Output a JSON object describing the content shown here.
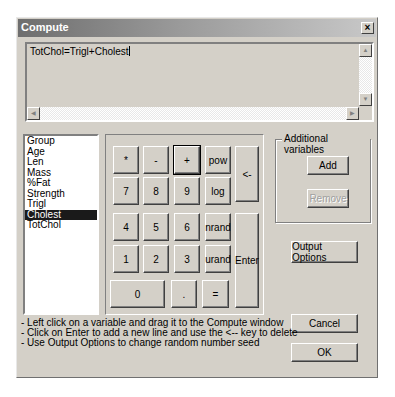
{
  "window": {
    "title": "Compute",
    "close_label": "×"
  },
  "editor": {
    "text": "TotChol=Trigl+Cholest"
  },
  "variables": {
    "items": [
      "Group",
      "Age",
      "Len",
      "Mass",
      "%Fat",
      "Strength",
      "Trigl",
      "Cholest",
      "TotChol"
    ],
    "selected": "Cholest"
  },
  "keypad": {
    "keys": [
      {
        "label": "*",
        "name": "key-multiply"
      },
      {
        "label": "-",
        "name": "key-minus"
      },
      {
        "label": "+",
        "name": "key-plus"
      },
      {
        "label": "pow",
        "name": "key-pow"
      },
      {
        "label": "<-",
        "name": "key-backspace"
      },
      {
        "label": "7",
        "name": "key-7"
      },
      {
        "label": "8",
        "name": "key-8"
      },
      {
        "label": "9",
        "name": "key-9"
      },
      {
        "label": "log",
        "name": "key-log"
      },
      {
        "label": "4",
        "name": "key-4"
      },
      {
        "label": "5",
        "name": "key-5"
      },
      {
        "label": "6",
        "name": "key-6"
      },
      {
        "label": "nrand",
        "name": "key-nrand"
      },
      {
        "label": "Enter",
        "name": "key-enter"
      },
      {
        "label": "1",
        "name": "key-1"
      },
      {
        "label": "2",
        "name": "key-2"
      },
      {
        "label": "3",
        "name": "key-3"
      },
      {
        "label": "urand",
        "name": "key-urand"
      },
      {
        "label": "0",
        "name": "key-0"
      },
      {
        "label": ".",
        "name": "key-decimal"
      },
      {
        "label": "=",
        "name": "key-equals"
      }
    ]
  },
  "additional_variables": {
    "label": "Additional variables",
    "add_label": "Add",
    "remove_label": "Remove"
  },
  "buttons": {
    "output_options": "Output Options",
    "cancel": "Cancel",
    "ok": "OK"
  },
  "help": [
    "- Left click on a variable and drag it to the Compute window",
    "- Click on Enter to add a new line and use the <-- key  to delete",
    "- Use Output Options to change random number seed"
  ]
}
